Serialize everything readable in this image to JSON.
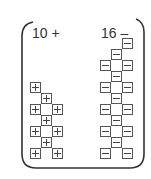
{
  "diagram": {
    "groups": [
      {
        "name": "positive",
        "label": "10 +",
        "count": 10,
        "tile_symbol": "+",
        "tile_icon": "plus-tile-icon"
      },
      {
        "name": "negative",
        "label": "16 –",
        "count": 16,
        "tile_symbol": "–",
        "tile_icon": "minus-tile-icon"
      }
    ],
    "colors": {
      "stroke": "#555555",
      "text": "#333333",
      "background": "#ffffff"
    }
  }
}
